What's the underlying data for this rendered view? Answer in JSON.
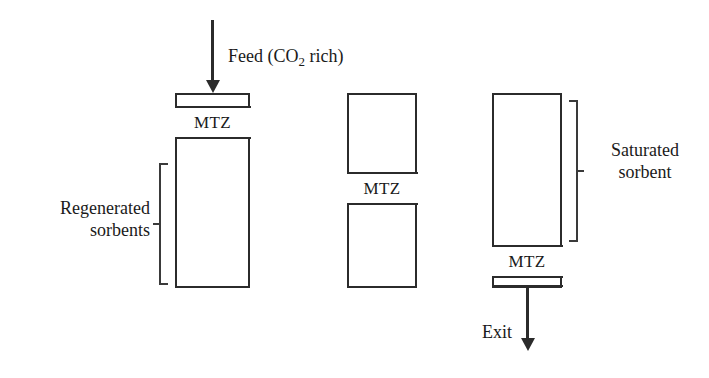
{
  "diagram": {
    "band_label": "MTZ",
    "feed_label_prefix": "Feed (CO",
    "feed_label_sub": "2",
    "feed_label_suffix": " rich)",
    "exit_label": "Exit",
    "regenerated_label": "Regenerated\nsorbents",
    "saturated_label": "Saturated\nsorbent",
    "colors": {
      "line": "#2b2b2b",
      "bracket": "#3a3a3a",
      "text": "#1a1a1a",
      "background": "#ffffff"
    },
    "columns": [
      {
        "name": "column-stage-1",
        "mtz_label": "MTZ",
        "mtz_position": "top",
        "state": "mostly regenerated"
      },
      {
        "name": "column-stage-2",
        "mtz_label": "MTZ",
        "mtz_position": "middle",
        "state": "partially saturated"
      },
      {
        "name": "column-stage-3",
        "mtz_label": "MTZ",
        "mtz_position": "bottom",
        "state": "mostly saturated"
      }
    ]
  }
}
